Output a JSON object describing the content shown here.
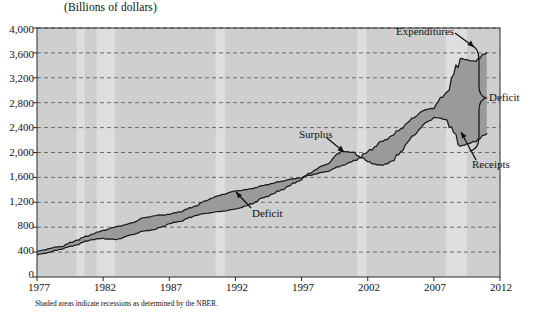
{
  "chart_data": {
    "type": "area",
    "title": "(Billions of dollars)",
    "xlabel": "",
    "ylabel": "(Billions of dollars)",
    "xlim": [
      1977,
      2012
    ],
    "ylim": [
      0,
      4000
    ],
    "xticks": [
      "1977",
      "1982",
      "1987",
      "1992",
      "1997",
      "2002",
      "2007",
      "2012"
    ],
    "xtick_values": [
      1977,
      1982,
      1987,
      1992,
      1997,
      2002,
      2007,
      2012
    ],
    "yticks": [
      "0",
      "400",
      "800",
      "1,200",
      "1,600",
      "2,000",
      "2,400",
      "2,800",
      "3,200",
      "3,600",
      "4,000"
    ],
    "ytick_values": [
      0,
      400,
      800,
      1200,
      1600,
      2000,
      2400,
      2800,
      3200,
      3600,
      4000
    ],
    "grid": true,
    "legend_position": "inline-annotations",
    "x": [
      1977,
      1978,
      1979,
      1980,
      1981,
      1982,
      1983,
      1984,
      1985,
      1986,
      1987,
      1988,
      1989,
      1990,
      1991,
      1992,
      1993,
      1994,
      1995,
      1996,
      1997,
      1998,
      1999,
      2000,
      2001,
      2002,
      2003,
      2004,
      2005,
      2006,
      2007,
      2008,
      2009,
      2010,
      2011
    ],
    "series": [
      {
        "name": "Expenditures",
        "values": [
          409,
          459,
          504,
          591,
          678,
          746,
          808,
          852,
          946,
          990,
          1004,
          1064,
          1143,
          1253,
          1324,
          1382,
          1409,
          1462,
          1516,
          1561,
          1601,
          1653,
          1702,
          1789,
          1863,
          2011,
          2160,
          2293,
          2472,
          2655,
          2729,
          2983,
          3518,
          3456,
          3603
        ]
      },
      {
        "name": "Receipts",
        "values": [
          356,
          400,
          463,
          517,
          599,
          618,
          601,
          666,
          734,
          769,
          854,
          909,
          991,
          1032,
          1055,
          1091,
          1154,
          1259,
          1352,
          1453,
          1579,
          1722,
          1827,
          2025,
          1991,
          1853,
          1782,
          1880,
          2154,
          2407,
          2568,
          2524,
          2105,
          2163,
          2303
        ]
      }
    ],
    "annotations": [
      {
        "label": "Expenditures",
        "x": 2008.0,
        "y": 3850,
        "arrow_to_x": 2009.3,
        "arrow_to_y": 3560
      },
      {
        "label": "Receipts",
        "x": 2010.0,
        "y": 1620,
        "arrow_to_x": 2008.8,
        "arrow_to_y": 2080
      },
      {
        "label": "Deficit",
        "x": 2012.2,
        "y": 2750,
        "note": "brace spanning gap between expenditures and receipts 2009-2011"
      },
      {
        "label": "Surplus",
        "x": 1998.8,
        "y": 2090,
        "arrow_to_x": 2000.0,
        "arrow_to_y": 1900
      },
      {
        "label": "Deficit",
        "x": 1991.5,
        "y": 1000,
        "arrow_to_x": 1989.6,
        "arrow_to_y": 1180
      }
    ],
    "recession_bands": [
      {
        "start": 1980.0,
        "end": 1980.6
      },
      {
        "start": 1981.5,
        "end": 1982.9
      },
      {
        "start": 1990.5,
        "end": 1991.2
      },
      {
        "start": 2001.2,
        "end": 2001.9
      },
      {
        "start": 2007.9,
        "end": 2009.5
      }
    ],
    "footnote": "Shaded areas indicate recessions as determined by the NBER.",
    "colors": {
      "plot_background": "#cfcfcf",
      "recession_band": "#dedede",
      "deficit_fill": "#9a9a9a",
      "surplus_fill": "#9a9a9a",
      "line": "#1a1a1a",
      "gridline": "#5f5f5f",
      "text": "#111111"
    }
  }
}
